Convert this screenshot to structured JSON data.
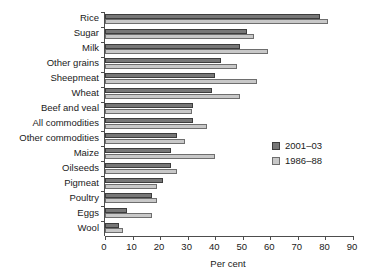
{
  "chart_data": {
    "type": "bar",
    "orientation": "horizontal",
    "title": "",
    "xlabel": "Per cent",
    "ylabel": "",
    "xlim": [
      0,
      90
    ],
    "xticks": [
      0,
      10,
      20,
      30,
      40,
      50,
      60,
      70,
      80,
      90
    ],
    "grid": false,
    "legend_position": "right-middle",
    "categories": [
      "Rice",
      "Sugar",
      "Milk",
      "Other grains",
      "Sheepmeat",
      "Wheat",
      "Beef and veal",
      "All commodities",
      "Other commodities",
      "Maize",
      "Oilseeds",
      "Pigmeat",
      "Poultry",
      "Eggs",
      "Wool"
    ],
    "series": [
      {
        "name": "2001–03",
        "color": "#777777",
        "values": [
          78,
          51.5,
          49,
          42,
          40,
          39,
          32,
          32,
          26,
          24,
          24,
          21,
          17,
          8,
          5
        ]
      },
      {
        "name": "1986–88",
        "color": "#c8c8c8",
        "values": [
          81,
          54,
          59,
          48,
          55,
          49,
          31.5,
          37,
          29,
          40,
          26,
          19,
          19,
          17,
          6.5
        ]
      }
    ]
  },
  "legend": {
    "entries": [
      {
        "label": "2001–03"
      },
      {
        "label": "1986–88"
      }
    ]
  },
  "axis": {
    "x_title": "Per cent"
  },
  "colors": {
    "series_1": "#777777",
    "series_2": "#c8c8c8",
    "axis": "#4d4d4d",
    "background": "#ffffff"
  }
}
